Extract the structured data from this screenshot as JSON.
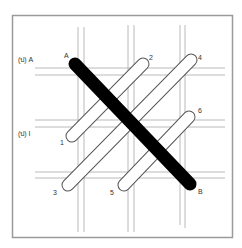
{
  "diagram": {
    "labels": {
      "row_a_marker": "(ป) A",
      "row_i_marker": "(ป) I",
      "end_a": "A",
      "end_b": "B",
      "n1": "1",
      "n2": "2",
      "n3": "3",
      "n4": "4",
      "n5": "5",
      "n6": "6"
    },
    "colors": {
      "frame": "#9a9a9a",
      "grid": "#a8a8a8",
      "rod_fill": "#ffffff",
      "rod_outline": "#555555",
      "main_rod": "#000000"
    }
  }
}
